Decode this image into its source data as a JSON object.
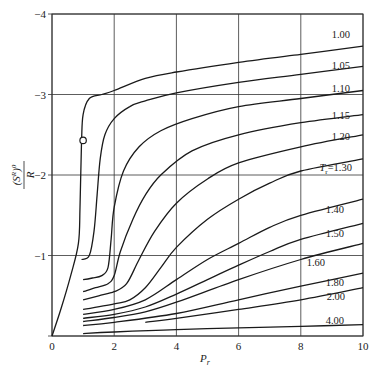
{
  "chart_data": {
    "type": "line",
    "title": "",
    "xlabel": "P_r",
    "ylabel": "(S^R)^0 / R",
    "xlim": [
      0,
      10
    ],
    "ylim": [
      0,
      -4
    ],
    "y_inverted": true,
    "grid": true,
    "x_ticks": [
      "0",
      "2",
      "4",
      "6",
      "8",
      "10"
    ],
    "y_ticks": [
      "0",
      "-1",
      "-2",
      "-3",
      "-4"
    ],
    "legend": "inline curve labels at right edge",
    "series": [
      {
        "name": "1.00",
        "label": "1.00",
        "x": [
          0.0,
          0.3,
          0.6,
          0.85,
          0.9,
          0.95,
          1.0,
          1.2,
          1.6,
          2.0,
          3.0,
          4.0,
          6.0,
          8.0,
          10.0
        ],
        "y": [
          0.0,
          -0.35,
          -0.75,
          -1.15,
          -1.6,
          -2.4,
          -2.75,
          -2.95,
          -3.0,
          -3.05,
          -3.2,
          -3.28,
          -3.4,
          -3.5,
          -3.6
        ]
      },
      {
        "name": "1.05",
        "label": "1.05",
        "x": [
          0.95,
          1.2,
          1.35,
          1.45,
          1.55,
          1.7,
          2.0,
          2.5,
          3.0,
          4.0,
          6.0,
          8.0,
          10.0
        ],
        "y": [
          -0.95,
          -1.0,
          -1.3,
          -1.75,
          -2.2,
          -2.5,
          -2.7,
          -2.85,
          -2.92,
          -3.02,
          -3.15,
          -3.25,
          -3.35
        ]
      },
      {
        "name": "1.10",
        "label": "1.10",
        "x": [
          1.0,
          1.3,
          1.6,
          1.8,
          1.9,
          2.0,
          2.3,
          2.8,
          3.5,
          4.5,
          6.0,
          8.0,
          10.0
        ],
        "y": [
          -0.7,
          -0.72,
          -0.75,
          -0.85,
          -1.2,
          -1.6,
          -2.05,
          -2.35,
          -2.55,
          -2.7,
          -2.85,
          -2.95,
          -3.05
        ]
      },
      {
        "name": "1.15",
        "label": "1.15",
        "x": [
          1.0,
          1.4,
          1.8,
          2.0,
          2.2,
          2.6,
          3.0,
          3.5,
          4.5,
          6.0,
          8.0,
          10.0
        ],
        "y": [
          -0.55,
          -0.6,
          -0.65,
          -0.75,
          -1.05,
          -1.45,
          -1.75,
          -2.0,
          -2.3,
          -2.5,
          -2.65,
          -2.75
        ]
      },
      {
        "name": "1.20",
        "label": "1.20",
        "x": [
          1.0,
          1.5,
          2.0,
          2.4,
          2.8,
          3.3,
          4.0,
          5.0,
          6.0,
          8.0,
          10.0
        ],
        "y": [
          -0.45,
          -0.5,
          -0.55,
          -0.65,
          -0.95,
          -1.3,
          -1.65,
          -1.95,
          -2.15,
          -2.35,
          -2.5
        ]
      },
      {
        "name": "1.30",
        "label": "T_r=1.30",
        "x": [
          1.0,
          2.0,
          2.5,
          3.0,
          3.5,
          4.0,
          5.0,
          6.0,
          7.0,
          8.0,
          10.0
        ],
        "y": [
          -0.33,
          -0.4,
          -0.45,
          -0.6,
          -0.85,
          -1.1,
          -1.45,
          -1.7,
          -1.9,
          -2.05,
          -2.2
        ]
      },
      {
        "name": "1.40",
        "label": "1.40",
        "x": [
          1.0,
          2.0,
          3.0,
          4.0,
          5.0,
          6.0,
          7.0,
          8.0,
          10.0
        ],
        "y": [
          -0.27,
          -0.33,
          -0.45,
          -0.7,
          -0.95,
          -1.15,
          -1.35,
          -1.5,
          -1.7
        ]
      },
      {
        "name": "1.50",
        "label": "1.50",
        "x": [
          1.0,
          2.0,
          3.0,
          4.0,
          5.0,
          6.0,
          7.0,
          8.0,
          10.0
        ],
        "y": [
          -0.22,
          -0.27,
          -0.36,
          -0.52,
          -0.7,
          -0.88,
          -1.05,
          -1.2,
          -1.4
        ]
      },
      {
        "name": "1.60",
        "label": "1.60",
        "x": [
          1.0,
          2.0,
          3.0,
          4.0,
          6.0,
          8.0,
          10.0
        ],
        "y": [
          -0.18,
          -0.23,
          -0.3,
          -0.42,
          -0.7,
          -0.95,
          -1.15
        ]
      },
      {
        "name": "1.80",
        "label": "1.80",
        "x": [
          1.0,
          2.0,
          4.0,
          6.0,
          8.0,
          10.0
        ],
        "y": [
          -0.13,
          -0.17,
          -0.28,
          -0.45,
          -0.62,
          -0.78
        ]
      },
      {
        "name": "2.00",
        "label": "2.00",
        "x": [
          3.0,
          4.0,
          6.0,
          8.0,
          10.0
        ],
        "y": [
          -0.17,
          -0.22,
          -0.33,
          -0.45,
          -0.6
        ]
      },
      {
        "name": "4.00",
        "label": "4.00",
        "x": [
          1.0,
          2.0,
          4.0,
          6.0,
          8.0,
          10.0
        ],
        "y": [
          -0.03,
          -0.05,
          -0.08,
          -0.1,
          -0.12,
          -0.14
        ]
      }
    ],
    "annotations": [
      {
        "type": "open-circle-marker",
        "x": 1.0,
        "y": -2.43,
        "note": "critical point on Tr=1.00 curve"
      }
    ]
  },
  "labels": {
    "x_axis": "P",
    "x_axis_sub": "r",
    "y_axis_num": "(S",
    "y_axis_sup": "R",
    "y_axis_close": ")",
    "y_axis_sup2": "0",
    "y_axis_den": "R",
    "tr_prefix": "T",
    "tr_sub": "r",
    "tr_value": "=1.30"
  },
  "colors": {
    "line": "#1a1a1a",
    "grid": "#333333",
    "background": "#ffffff"
  }
}
